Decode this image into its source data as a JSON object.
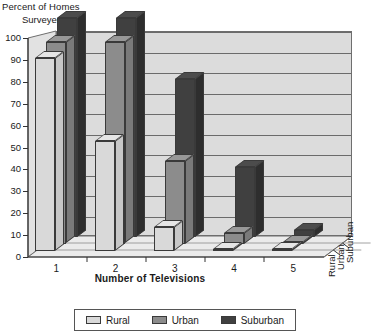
{
  "chart_data": {
    "type": "bar",
    "title": "",
    "ylabel_line1": "Percent of Homes",
    "ylabel_line2": "Surveyed",
    "xlabel": "Number of Televisions",
    "categories": [
      "1",
      "2",
      "3",
      "4",
      "5"
    ],
    "depth_categories": [
      "Rural",
      "Urban",
      "Suburban"
    ],
    "ylim": [
      0,
      100
    ],
    "yticks": [
      "0",
      "10",
      "20",
      "30",
      "40",
      "50",
      "60",
      "70",
      "80",
      "90",
      "100"
    ],
    "grid": true,
    "legend_position": "bottom",
    "series": [
      {
        "name": "Rural",
        "color": "#d9d9d9",
        "values": [
          88,
          50,
          11,
          1,
          0
        ]
      },
      {
        "name": "Urban",
        "color": "#8c8c8c",
        "values": [
          92,
          92,
          38,
          5,
          1
        ]
      },
      {
        "name": "Suburban",
        "color": "#404040",
        "values": [
          100,
          100,
          72,
          32,
          3
        ]
      }
    ]
  },
  "legend": {
    "entries": [
      {
        "label": "Rural"
      },
      {
        "label": "Urban"
      },
      {
        "label": "Suburban"
      }
    ]
  }
}
